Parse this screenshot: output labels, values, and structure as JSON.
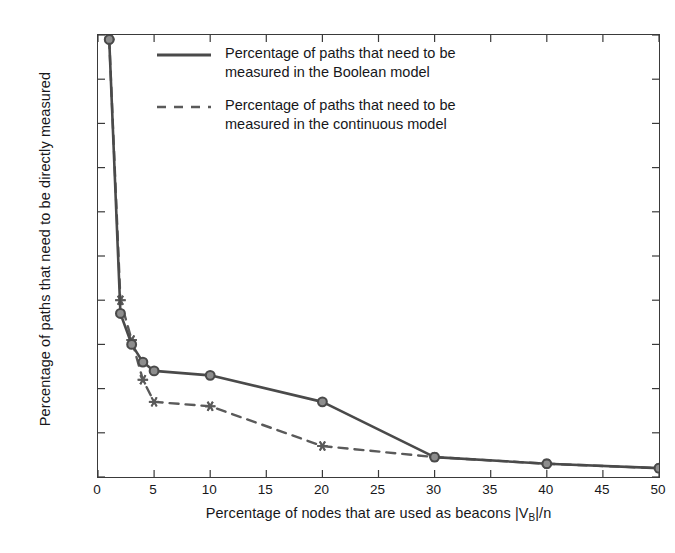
{
  "chart_data": {
    "type": "line",
    "title": "",
    "xlabel": "Percentage of nodes that are used as beacons |V_B|/n",
    "xlabel_prefix": "Percentage of nodes that are used as beacons ",
    "xlabel_bar_open": "|",
    "xlabel_v": "V",
    "xlabel_sub": "B",
    "xlabel_bar_close": "|",
    "xlabel_suffix": "/n",
    "ylabel": "Percentage of paths that need to be directly measured",
    "xlim": [
      0,
      50
    ],
    "ylim": [
      0,
      100
    ],
    "xticks": [
      0,
      5,
      10,
      15,
      20,
      25,
      30,
      35,
      40,
      45,
      50
    ],
    "yticks": [
      0,
      10,
      20,
      30,
      40,
      50,
      60,
      70,
      80,
      90,
      100
    ],
    "grid": false,
    "legend_position": "upper-center-inside",
    "x": [
      1,
      2,
      3,
      4,
      5,
      10,
      20,
      30,
      40,
      50
    ],
    "series": [
      {
        "name": "continuous",
        "label_line1": "Percentage of paths that need to be",
        "label_line2": "measured in the continuous model",
        "linestyle": "dashed",
        "marker": "star",
        "color": "#5a5a5a",
        "values": [
          99,
          40,
          31,
          22,
          17,
          16,
          7,
          4.5,
          3,
          2
        ]
      },
      {
        "name": "boolean",
        "label_line1": "Percentage of paths that need to be",
        "label_line2": "measured in the Boolean model",
        "linestyle": "solid",
        "marker": "circle",
        "color": "#4a4a4a",
        "values": [
          99,
          37,
          30,
          26,
          24,
          23,
          17,
          4.5,
          3,
          2
        ]
      }
    ]
  },
  "style": {
    "axis_color": "#3a3a3a",
    "text_color": "#17171a",
    "background": "#ffffff"
  }
}
